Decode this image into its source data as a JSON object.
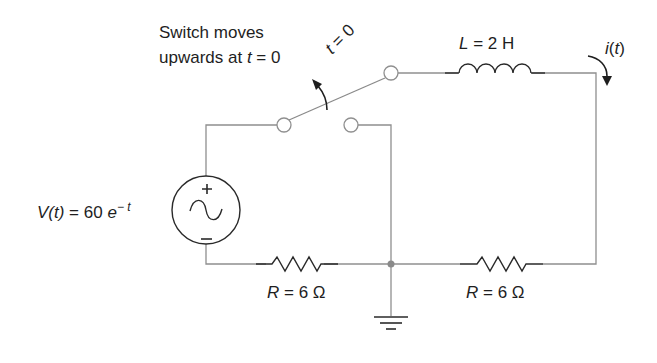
{
  "annotation": {
    "switch_line1": "Switch moves",
    "switch_line2_prefix": "upwards at ",
    "switch_line2_var": "t",
    "switch_line2_suffix": " = 0",
    "switch_time_var": "t",
    "switch_time_suffix": " = 0"
  },
  "components": {
    "inductor": {
      "var": "L",
      "value": " = 2 H"
    },
    "current": {
      "prefix": "i",
      "paren_open": "(",
      "var": "t",
      "paren_close": ")"
    },
    "source": {
      "var": "V",
      "arg": "(t)",
      "eq": " = 60 ",
      "base": "e",
      "exponent": "− t",
      "plus": "+",
      "minus": "−"
    },
    "resistor_left": {
      "var": "R",
      "value": " = 6 Ω"
    },
    "resistor_right": {
      "var": "R",
      "value": " = 6 Ω"
    }
  },
  "colors": {
    "wire": "#9a9a9a",
    "ink": "#1e1e1e",
    "node": "#8a8a8a"
  }
}
